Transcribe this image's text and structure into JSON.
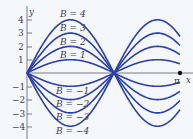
{
  "chart_data": {
    "type": "line",
    "title": "",
    "xlabel": "x",
    "ylabel": "y",
    "formula_hint": "y = B * |sin(k x)|, zeros at x = 0 and x ≈ 0.57π",
    "x_range": [
      0,
      3.14159
    ],
    "x_tick_labels": [
      "π"
    ],
    "y_ticks": [
      4,
      3,
      2,
      1,
      -1,
      -2,
      -3,
      -4
    ],
    "ylim": [
      -4.5,
      4.5
    ],
    "grid": false,
    "legend_position": "inline labels",
    "series": [
      {
        "name": "B = 4",
        "B": 4
      },
      {
        "name": "B = 3",
        "B": 3
      },
      {
        "name": "B = 2",
        "B": 2
      },
      {
        "name": "B = 1",
        "B": 1
      },
      {
        "name": "B = −1",
        "B": -1
      },
      {
        "name": "B = −2",
        "B": -2
      },
      {
        "name": "B = −3",
        "B": -3
      },
      {
        "name": "B = −4",
        "B": -4
      }
    ],
    "curve_color": "#2a3fa8"
  },
  "labels": {
    "x_axis": "x",
    "y_axis": "y",
    "pi": "π",
    "ticks": [
      "4",
      "3",
      "2",
      "1",
      "−1",
      "−2",
      "−3",
      "−4"
    ],
    "B": [
      "B = 4",
      "B = 3",
      "B = 2",
      "B = 1",
      "B = −1",
      "B = −2",
      "B = −3",
      "B = −4"
    ]
  }
}
